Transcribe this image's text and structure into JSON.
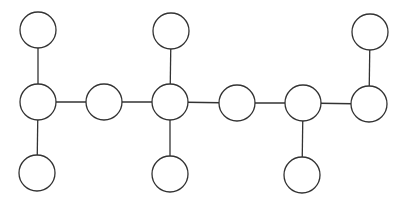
{
  "diagram": {
    "type": "graph",
    "stroke_color": "#333333",
    "fill_color": "#ffffff",
    "radius": 18,
    "nodes": [
      {
        "id": "A",
        "x": 38,
        "y": 30
      },
      {
        "id": "B",
        "x": 38,
        "y": 102
      },
      {
        "id": "C",
        "x": 37,
        "y": 173
      },
      {
        "id": "D",
        "x": 104,
        "y": 102
      },
      {
        "id": "E",
        "x": 171,
        "y": 31
      },
      {
        "id": "F",
        "x": 170,
        "y": 102
      },
      {
        "id": "G",
        "x": 170,
        "y": 174
      },
      {
        "id": "H",
        "x": 237,
        "y": 103
      },
      {
        "id": "I",
        "x": 303,
        "y": 103
      },
      {
        "id": "J",
        "x": 302,
        "y": 175
      },
      {
        "id": "K",
        "x": 370,
        "y": 32
      },
      {
        "id": "L",
        "x": 369,
        "y": 104
      }
    ],
    "edges": [
      [
        "A",
        "B"
      ],
      [
        "B",
        "C"
      ],
      [
        "B",
        "D"
      ],
      [
        "D",
        "F"
      ],
      [
        "E",
        "F"
      ],
      [
        "F",
        "G"
      ],
      [
        "F",
        "H"
      ],
      [
        "H",
        "I"
      ],
      [
        "I",
        "J"
      ],
      [
        "I",
        "L"
      ],
      [
        "K",
        "L"
      ]
    ]
  }
}
